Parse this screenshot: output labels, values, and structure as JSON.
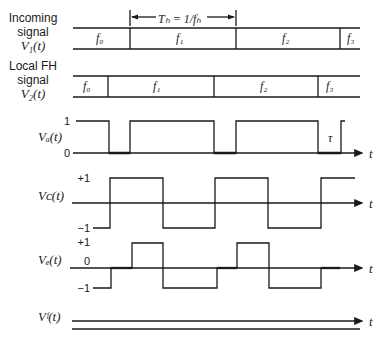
{
  "diagram": {
    "type": "timing-diagram",
    "topic": "Frequency-hopping signal synchronization waveforms",
    "rows": [
      {
        "id": "incoming",
        "label_lines": [
          "Incoming",
          "signal",
          "V₁(t)"
        ],
        "segments": [
          {
            "label": "f₀"
          },
          {
            "label": "f₁"
          },
          {
            "label": "f₂"
          },
          {
            "label": "f₃"
          }
        ]
      },
      {
        "id": "local-fh",
        "label_lines": [
          "Local FH",
          "signal",
          "V₂(t)"
        ],
        "segments": [
          {
            "label": "f₀"
          },
          {
            "label": "f₁"
          },
          {
            "label": "f₂"
          },
          {
            "label": "f₃"
          }
        ]
      },
      {
        "id": "vd",
        "label": "Vₐ(t)",
        "levels": [
          "1",
          "0"
        ],
        "annotation": "τ",
        "axis_label": "t"
      },
      {
        "id": "vc",
        "label": "Vᴄ(t)",
        "levels": [
          "+1",
          "−1"
        ],
        "axis_label": "t"
      },
      {
        "id": "ve",
        "label": "Vₑ(t)",
        "levels": [
          "+1",
          "0",
          "−1"
        ],
        "axis_label": "t"
      },
      {
        "id": "vf",
        "label": "Vᶠ(t)",
        "axis_label": "t"
      }
    ],
    "hop_period": {
      "label": "Tₕ = 1/fₕ"
    }
  }
}
